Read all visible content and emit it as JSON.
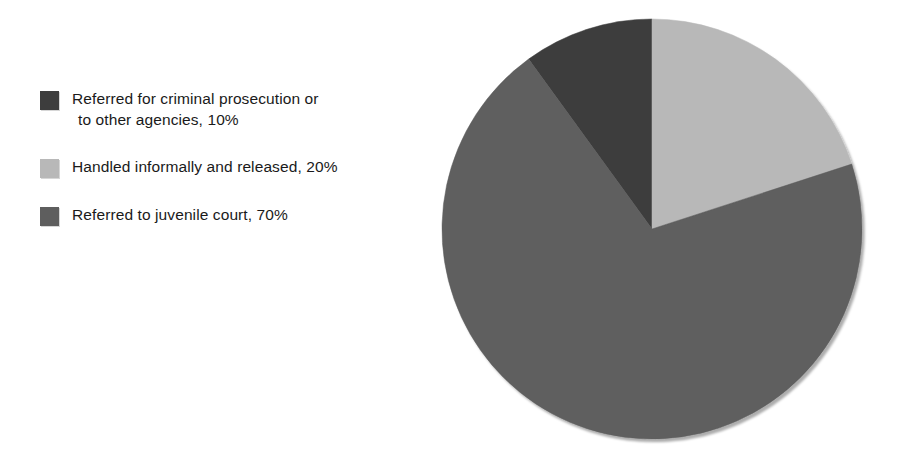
{
  "chart_data": {
    "type": "pie",
    "title": "",
    "subtitle": "",
    "xlabel": "",
    "ylabel": "",
    "grid": false,
    "legend_position": "left",
    "start_angle_deg": 0,
    "direction": "clockwise",
    "units": "percent",
    "total": 100,
    "categories": [
      "Referred for criminal prosecution or to other agencies",
      "Handled informally and released",
      "Referred to juvenile court"
    ],
    "values": [
      10,
      20,
      70
    ],
    "slices": [
      {
        "label": "Referred for criminal prosecution or\n to other agencies, 10%",
        "label_line1": "Referred for criminal prosecution or",
        "label_line2": "to other agencies, 10%",
        "category": "Referred for criminal prosecution or to other agencies",
        "value": 10,
        "value_text": "10%",
        "color": "#3d3d3d",
        "start_deg": 324,
        "end_deg": 360,
        "swatch_name": "legend-swatch-criminal-prosecution"
      },
      {
        "label": "Handled informally and released, 20%",
        "label_line1": "Handled informally and released, 20%",
        "label_line2": "",
        "category": "Handled informally and released",
        "value": 20,
        "value_text": "20%",
        "color": "#b8b8b8",
        "start_deg": 0,
        "end_deg": 72,
        "swatch_name": "legend-swatch-handled-informally"
      },
      {
        "label": "Referred to juvenile court, 70%",
        "label_line1": "Referred to juvenile court, 70%",
        "label_line2": "",
        "category": "Referred to juvenile court",
        "value": 70,
        "value_text": "70%",
        "color": "#5e5e5e",
        "start_deg": 72,
        "end_deg": 324,
        "swatch_name": "legend-swatch-juvenile-court"
      }
    ],
    "colors": {
      "slice_criminal_prosecution": "#3d3d3d",
      "slice_handled_informally": "#b8b8b8",
      "slice_juvenile_court": "#5e5e5e",
      "background": "#ffffff",
      "text": "#1a1a1a"
    },
    "geometry": {
      "center_x": 222,
      "center_y": 229,
      "radius": 210
    }
  },
  "legend": {
    "items": [
      {
        "label": "Referred for criminal prosecution or\n to other agencies, 10%",
        "color": "#3d3d3d"
      },
      {
        "label": "Handled informally and released, 20%",
        "color": "#b8b8b8"
      },
      {
        "label": "Referred to juvenile court, 70%",
        "color": "#5e5e5e"
      }
    ]
  }
}
